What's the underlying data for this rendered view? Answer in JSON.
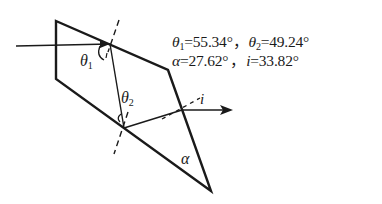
{
  "diagram": {
    "type": "prism-refraction",
    "labels": {
      "theta1": "θ",
      "theta1_sub": "1",
      "theta2": "θ",
      "theta2_sub": "2",
      "alpha": "α",
      "i": "i"
    },
    "values": {
      "line1": {
        "theta1_sym": "θ",
        "theta1_sub": "1",
        "theta1_val": "=55.34°",
        "sep1": "，",
        "theta2_sym": "θ",
        "theta2_sub": "2",
        "theta2_val": "=49.24°"
      },
      "line2": {
        "alpha_sym": "α",
        "alpha_val": "=27.62°",
        "sep2": "，",
        "i_sym": "i",
        "i_val": "=33.82°"
      }
    },
    "colors": {
      "stroke": "#1a1a1a",
      "background": "#ffffff"
    }
  }
}
